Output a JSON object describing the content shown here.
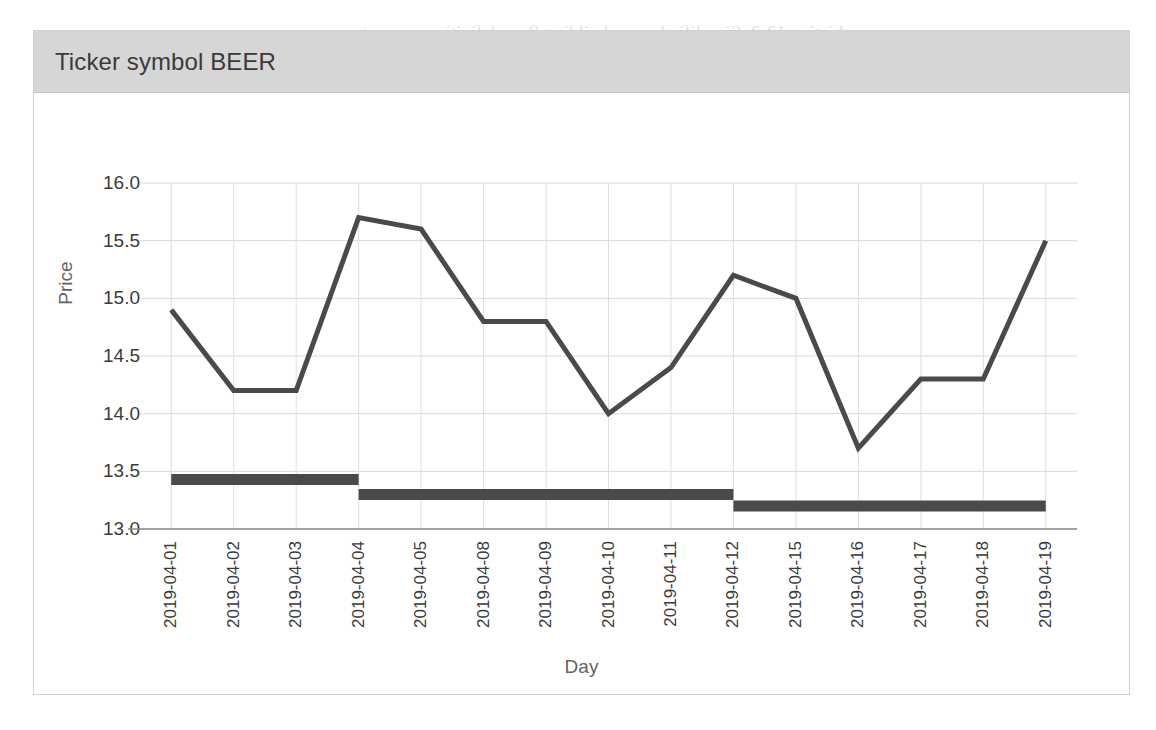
{
  "card": {
    "title": "Ticker symbol BEER"
  },
  "chart_data": {
    "type": "line",
    "title": "Ticker symbol BEER",
    "xlabel": "Day",
    "ylabel": "Price",
    "ylim": [
      13.0,
      16.0
    ],
    "ytick_labels": [
      "13.0",
      "13.5",
      "14.0",
      "14.5",
      "15.0",
      "15.5",
      "16.0"
    ],
    "ytick_values": [
      13.0,
      13.5,
      14.0,
      14.5,
      15.0,
      15.5,
      16.0
    ],
    "grid": true,
    "legend_position": "none",
    "line_color": "#4a4a4a",
    "step_color": "#4a4a4a",
    "categories": [
      "2019-04-01",
      "2019-04-02",
      "2019-04-03",
      "2019-04-04",
      "2019-04-05",
      "2019-04-08",
      "2019-04-09",
      "2019-04-10",
      "2019-04-11",
      "2019-04-12",
      "2019-04-15",
      "2019-04-16",
      "2019-04-17",
      "2019-04-18",
      "2019-04-19"
    ],
    "series": [
      {
        "name": "Price",
        "type": "line",
        "values": [
          14.9,
          14.2,
          14.2,
          15.7,
          15.6,
          14.8,
          14.8,
          14.0,
          14.4,
          15.2,
          15.0,
          13.7,
          14.3,
          14.3,
          15.5
        ]
      },
      {
        "name": "Support level",
        "type": "step",
        "values": [
          13.43,
          13.43,
          13.43,
          13.3,
          13.3,
          13.3,
          13.3,
          13.3,
          13.3,
          13.2,
          13.2,
          13.2,
          13.2,
          13.2,
          13.2
        ]
      }
    ]
  },
  "background_text": [
    {
      "text": "Listing 12-2: Simplified query building flow definitions are not",
      "x": 362,
      "y": 22,
      "size": 19
    },
    {
      "text": "building",
      "x": 1005,
      "y": 56,
      "size": 19
    },
    {
      "text": "match",
      "x": 718,
      "y": 152,
      "size": 18
    },
    {
      "text": "extract ranges",
      "x": 712,
      "y": 190,
      "size": 18
    },
    {
      "text": "strict response",
      "x": 700,
      "y": 238,
      "size": 18
    },
    {
      "text": "max titanium overlap",
      "x": 700,
      "y": 282,
      "size": 18
    },
    {
      "text": "order by category",
      "x": 708,
      "y": 324,
      "size": 18
    },
    {
      "text": "escaping",
      "x": 730,
      "y": 366,
      "size": 18
    },
    {
      "text": "b match to res_match",
      "x": 660,
      "y": 418,
      "size": 18
    },
    {
      "text": "descending",
      "x": 700,
      "y": 452,
      "size": 18
    },
    {
      "text": "01  extract_clauses   last_y",
      "x": 610,
      "y": 512,
      "size": 18
    },
    {
      "text": "02  common_prefix_match",
      "x": 608,
      "y": 552,
      "size": 18
    },
    {
      "text": "03  after match_infoto last",
      "x": 608,
      "y": 592,
      "size": 18
    },
    {
      "text": "04  pattern_a",
      "x": 640,
      "y": 628,
      "size": 18
    },
    {
      "text": "05  extract_down_upper",
      "x": 612,
      "y": 668,
      "size": 18
    }
  ]
}
